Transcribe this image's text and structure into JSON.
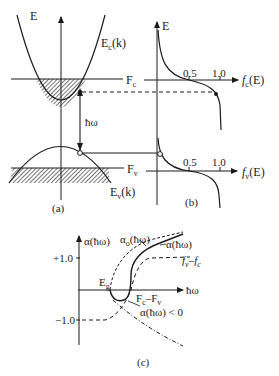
{
  "figure": {
    "colors": {
      "ink": "#1a1a1a",
      "background": "#ffffff"
    },
    "panel_a": {
      "caption": "(a)",
      "axis_label_E": "E",
      "conduction_band_label": "E",
      "conduction_band_sub": "c",
      "conduction_band_suffix": "(k)",
      "valence_band_label": "E",
      "valence_band_sub": "v",
      "valence_band_suffix": "(k)",
      "fermi_c_label": "F",
      "fermi_c_sub": "c",
      "fermi_v_label": "F",
      "fermi_v_sub": "v",
      "photon_label": "ħω"
    },
    "panel_b": {
      "caption": "(b)",
      "axis_label_E": "E",
      "fc_axis_label": "f",
      "fc_axis_sub": "c",
      "fc_axis_suffix": "(E)",
      "fv_axis_label": "f",
      "fv_axis_sub": "v",
      "fv_axis_suffix": "(E)",
      "tick_half": "0.5",
      "tick_one": "1.0"
    },
    "panel_c": {
      "caption": "(c)",
      "y_axis_label": "α(ħω)",
      "x_axis_label": "ħω",
      "tick_pos": "+1.0",
      "tick_neg": "−1.0",
      "eg_label": "E",
      "eg_sub": "g",
      "alpha0_label": "α",
      "alpha0_sub": "o",
      "alpha0_suffix": "(ħω)",
      "alpha_label": "α(ħω)",
      "fvfc_label": "f",
      "fvfc_sub1": "v",
      "fvfc_mid": "–f",
      "fvfc_sub2": "c",
      "fcfv_label": "F",
      "fcfv_sub1": "c",
      "fcfv_mid": "–F",
      "fcfv_sub2": "v",
      "alpha_neg_label": "α(ħω) < 0"
    }
  }
}
